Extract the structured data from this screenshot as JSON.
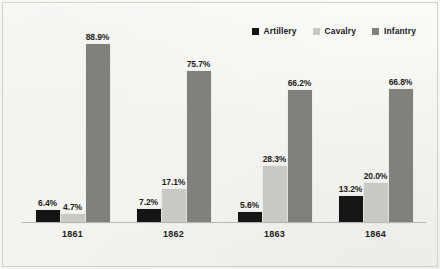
{
  "chart_data": {
    "type": "bar",
    "title": "",
    "subtitle": "",
    "xlabel": "",
    "ylabel": "",
    "ylim": [
      0,
      100
    ],
    "grid": false,
    "legend_position": "top-right",
    "categories": [
      "1861",
      "1862",
      "1863",
      "1864"
    ],
    "series": [
      {
        "name": "Artillery",
        "color": "#151515",
        "values": [
          6.4,
          7.2,
          5.6,
          13.2
        ],
        "labels": [
          "6.4%",
          "7.2%",
          "5.6%",
          "13.2%"
        ]
      },
      {
        "name": "Cavalry",
        "color": "#c9c9c5",
        "values": [
          4.7,
          17.1,
          28.3,
          20.0
        ],
        "labels": [
          "4.7%",
          "17.1%",
          "28.3%",
          "20.0%"
        ]
      },
      {
        "name": "Infantry",
        "color": "#80807c",
        "values": [
          88.9,
          75.7,
          66.2,
          66.8
        ],
        "labels": [
          "88.9%",
          "75.7%",
          "66.2%",
          "66.8%"
        ]
      }
    ]
  },
  "legend": {
    "items": [
      {
        "label": "Artillery",
        "swatch_name": "legend-swatch-artillery"
      },
      {
        "label": "Cavalry",
        "swatch_name": "legend-swatch-cavalry"
      },
      {
        "label": "Infantry",
        "swatch_name": "legend-swatch-infantry"
      }
    ]
  },
  "axis": {
    "tick_labels": [
      "1861",
      "1862",
      "1863",
      "1864"
    ]
  }
}
